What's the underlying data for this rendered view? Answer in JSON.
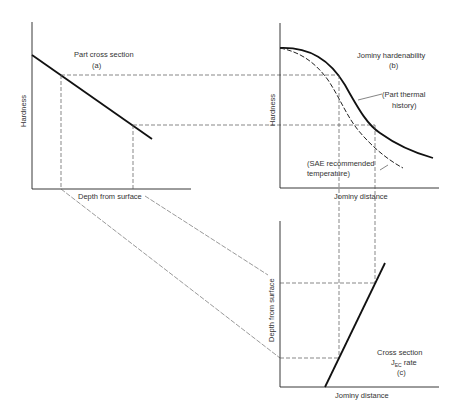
{
  "diagram": {
    "colors": {
      "line": "#222222",
      "dash": "#555555",
      "text": "#333333",
      "background": "#ffffff"
    },
    "panel_a": {
      "title": "Part cross section",
      "tag": "(a)",
      "ylabel": "Hardness",
      "xlabel": "Depth from surface"
    },
    "panel_b": {
      "title": "Jominy hardenability",
      "tag": "(b)",
      "ylabel": "Hardness",
      "xlabel": "Jominy distance",
      "curve_solid_label_1": "(Part thermal",
      "curve_solid_label_2": "history)",
      "curve_dashed_label_1": "(SAE recommended",
      "curve_dashed_label_2": "temperature)"
    },
    "panel_c": {
      "title": "Cross section",
      "rate_main": "J",
      "rate_sub": "EC",
      "rate_suffix": " rate",
      "tag": "(c)",
      "ylabel": "Depth from surface",
      "xlabel": "Jominy distance"
    }
  }
}
